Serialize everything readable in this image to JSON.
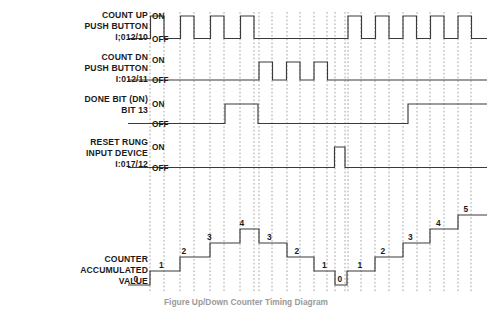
{
  "figure": {
    "caption": "Figure   Up/Down Counter Timing Diagram",
    "background_color": "#ffffff",
    "line_color": "#3a3a3a",
    "grid_color": "#8e8e8e"
  },
  "level_labels": {
    "on": "ON",
    "off": "OFF"
  },
  "rows": [
    {
      "id": "count-up",
      "name": "count-up-push-button",
      "lines": [
        "COUNT UP",
        "PUSH BUTTON",
        "I;012/10"
      ],
      "signal_type": "digital",
      "pulses": [
        [
          150.5,
          164.0
        ],
        [
          180.5,
          194.0
        ],
        [
          210.5,
          224.0
        ],
        [
          240.5,
          254.0
        ],
        [
          348.0,
          361.5
        ],
        [
          375.5,
          389.0
        ],
        [
          403.0,
          416.5
        ],
        [
          430.5,
          444.0
        ],
        [
          458.0,
          471.5
        ]
      ]
    },
    {
      "id": "count-dn",
      "name": "count-down-push-button",
      "lines": [
        "COUNT DN",
        "PUSH BUTTON",
        "I:012/11"
      ],
      "signal_type": "digital",
      "pulses": [
        [
          259.0,
          272.5
        ],
        [
          286.5,
          300.0
        ],
        [
          314.0,
          327.5
        ]
      ]
    },
    {
      "id": "done-bit",
      "name": "done-bit",
      "lines": [
        "DONE BIT (DN)",
        "BIT 13"
      ],
      "signal_type": "digital",
      "pulses": [
        [
          225.0,
          258.0
        ],
        [
          408.0,
          487.0
        ]
      ]
    },
    {
      "id": "reset-rung",
      "name": "reset-rung-input-device",
      "lines": [
        "RESET RUNG",
        "INPUT DEVICE",
        "I:017/12"
      ],
      "signal_type": "digital",
      "pulses": [
        [
          334.5,
          345.0
        ]
      ]
    },
    {
      "id": "accumulated",
      "name": "counter-accumulated-value",
      "lines": [
        "COUNTER",
        "ACCUMULATED",
        "VALUE"
      ],
      "signal_type": "staircase"
    }
  ],
  "chart_data": {
    "type": "line",
    "title": "Up/Down Counter Timing Diagram",
    "xlabel": "",
    "ylabel": "",
    "accumulated_steps": [
      {
        "value": 0,
        "x_start": 128.0,
        "x_end": 150.0,
        "label_x": 133.5
      },
      {
        "value": 1,
        "x_start": 150.0,
        "x_end": 180.0,
        "label_x": 159.0
      },
      {
        "value": 2,
        "x_start": 180.0,
        "x_end": 210.0,
        "label_x": 181.5
      },
      {
        "value": 3,
        "x_start": 210.0,
        "x_end": 240.0,
        "label_x": 207.0
      },
      {
        "value": 4,
        "x_start": 240.0,
        "x_end": 259.0,
        "label_x": 239.5
      },
      {
        "value": 3,
        "x_start": 259.0,
        "x_end": 287.0,
        "label_x": 267.0
      },
      {
        "value": 2,
        "x_start": 287.0,
        "x_end": 314.0,
        "label_x": 294.5
      },
      {
        "value": 1,
        "x_start": 314.0,
        "x_end": 335.0,
        "label_x": 322.0
      },
      {
        "value": 0,
        "x_start": 335.0,
        "x_end": 347.0,
        "label_x": 337.5
      },
      {
        "value": 1,
        "x_start": 347.0,
        "x_end": 375.0,
        "label_x": 357.5
      },
      {
        "value": 2,
        "x_start": 375.0,
        "x_end": 403.0,
        "label_x": 380.5
      },
      {
        "value": 3,
        "x_start": 403.0,
        "x_end": 430.0,
        "label_x": 408.0
      },
      {
        "value": 4,
        "x_start": 430.0,
        "x_end": 458.0,
        "label_x": 436.0
      },
      {
        "value": 5,
        "x_start": 458.0,
        "x_end": 487.0,
        "label_x": 463.5
      }
    ],
    "gridline_x": [
      150,
      164,
      180,
      194,
      210,
      224,
      240,
      254,
      259,
      272,
      287,
      300,
      314,
      327,
      335,
      345,
      348,
      361,
      375,
      389,
      403,
      417,
      430,
      444,
      458,
      471
    ],
    "series": [
      {
        "name": "COUNT UP PUSH BUTTON I;012/10",
        "pulse_count": 9
      },
      {
        "name": "COUNT DN PUSH BUTTON I:012/11",
        "pulse_count": 3
      },
      {
        "name": "DONE BIT (DN) BIT 13",
        "pulse_count": 2
      },
      {
        "name": "RESET RUNG INPUT DEVICE I:017/12",
        "pulse_count": 1
      }
    ]
  }
}
